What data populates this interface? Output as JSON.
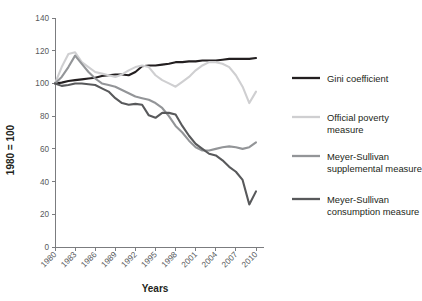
{
  "chart_data": {
    "type": "line",
    "title": "",
    "xlabel": "Years",
    "ylabel": "1980 = 100",
    "xlim": [
      1980,
      2010
    ],
    "ylim": [
      0,
      140
    ],
    "ytick_step": 20,
    "xtick_step": 3,
    "grid": false,
    "legend_position": "right",
    "yticks": [
      "0",
      "20",
      "40",
      "60",
      "80",
      "100",
      "120",
      "140"
    ],
    "xticks": [
      "1980",
      "1983",
      "1986",
      "1989",
      "1992",
      "1995",
      "1998",
      "2001",
      "2004",
      "2007",
      "2010"
    ],
    "x": [
      1980,
      1981,
      1982,
      1983,
      1984,
      1985,
      1986,
      1987,
      1988,
      1989,
      1990,
      1991,
      1992,
      1993,
      1994,
      1995,
      1996,
      1997,
      1998,
      1999,
      2000,
      2001,
      2002,
      2003,
      2004,
      2005,
      2006,
      2007,
      2008,
      2009,
      2010
    ],
    "series": [
      {
        "name": "Gini coefficient",
        "color": "#231f20",
        "width": 2.1,
        "values": [
          100,
          100.5,
          101.5,
          102,
          102.5,
          103,
          103.5,
          104.5,
          105,
          105.5,
          105.5,
          105,
          107,
          110.5,
          111,
          111,
          111.5,
          112,
          113,
          113,
          113.5,
          113.5,
          114,
          114,
          114,
          114.5,
          115,
          115,
          115,
          115,
          115.5
        ]
      },
      {
        "name": "Official poverty measure",
        "color": "#cfcfd1",
        "width": 2.1,
        "values": [
          100,
          110,
          118,
          119,
          113,
          110,
          107,
          106,
          105,
          104,
          105.5,
          108,
          110,
          111,
          110,
          105,
          102,
          100,
          98,
          101,
          104,
          108,
          111,
          113,
          113,
          112,
          110,
          105,
          98,
          88,
          95
        ]
      },
      {
        "name": "Meyer-Sullivan supplemental measure",
        "color": "#939598",
        "width": 2.1,
        "values": [
          100,
          104,
          110,
          117,
          112,
          107,
          103,
          100,
          99,
          98,
          96,
          94,
          92,
          91,
          90,
          88,
          85,
          80,
          74,
          70,
          65,
          61,
          59,
          59,
          60,
          61,
          61.5,
          61,
          60,
          61,
          64
        ]
      },
      {
        "name": "Meyer-Sullivan consumption measure",
        "color": "#58595b",
        "width": 2.1,
        "values": [
          100,
          98.5,
          99,
          100,
          100,
          99.5,
          99,
          97,
          95,
          91,
          88,
          87,
          87.5,
          87,
          80.5,
          79,
          82,
          82,
          81,
          74,
          68,
          63,
          60,
          57,
          56,
          53,
          49,
          46,
          41,
          26,
          34
        ]
      }
    ],
    "legend_items": [
      {
        "label_lines": [
          "Gini coefficient"
        ],
        "color": "#231f20"
      },
      {
        "label_lines": [
          "Official poverty",
          "measure"
        ],
        "color": "#cfcfd1"
      },
      {
        "label_lines": [
          "Meyer-Sullivan",
          "supplemental measure"
        ],
        "color": "#939598"
      },
      {
        "label_lines": [
          "Meyer-Sullivan",
          "consumption measure"
        ],
        "color": "#58595b"
      }
    ]
  }
}
